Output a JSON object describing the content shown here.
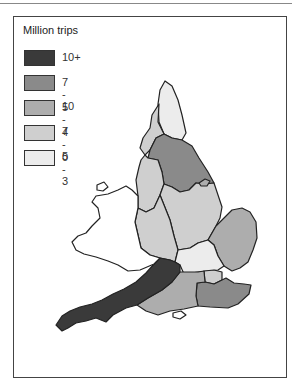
{
  "title": "Million trips",
  "legend": [
    {
      "label": "10+",
      "color": "#3a3a3a"
    },
    {
      "label": "7 - 10",
      "color": "#8a8a8a"
    },
    {
      "label": "5 - 7",
      "color": "#adadad"
    },
    {
      "label": "4 - 5",
      "color": "#cfcfcf"
    },
    {
      "label": "0 - 3",
      "color": "#ececec"
    }
  ],
  "regions": [
    {
      "name": "Northumbria",
      "band": "0 - 3"
    },
    {
      "name": "Cumbria",
      "band": "4 - 5"
    },
    {
      "name": "Yorkshire",
      "band": "7 - 10"
    },
    {
      "name": "North West",
      "band": "4 - 5"
    },
    {
      "name": "East Midlands",
      "band": "4 - 5"
    },
    {
      "name": "Heart of England",
      "band": "4 - 5"
    },
    {
      "name": "East Anglia",
      "band": "5 - 7"
    },
    {
      "name": "Thames & Chilterns",
      "band": "0 - 3"
    },
    {
      "name": "London",
      "band": "4 - 5"
    },
    {
      "name": "South East",
      "band": "7 - 10"
    },
    {
      "name": "Southern",
      "band": "5 - 7"
    },
    {
      "name": "West Country",
      "band": "10+"
    },
    {
      "name": "Wales",
      "band": "none"
    }
  ]
}
